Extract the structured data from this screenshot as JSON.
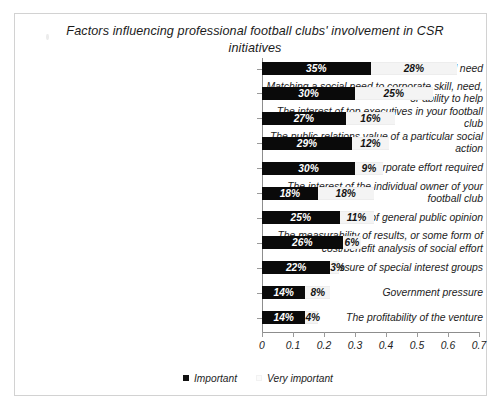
{
  "chart_data": {
    "type": "bar",
    "orientation": "horizontal",
    "stacked": true,
    "title": "Factors influencing professional football clubs' involvement in CSR initiatives",
    "xlabel": "",
    "ylabel": "",
    "xlim": [
      0,
      0.7
    ],
    "xticks": [
      "0",
      "0.1",
      "0.2",
      "0.3",
      "0.4",
      "0.5",
      "0.6",
      "0.7"
    ],
    "xtick_values": [
      0,
      0.1,
      0.2,
      0.3,
      0.4,
      0.5,
      0.6,
      0.7
    ],
    "grid": false,
    "legend_position": "bottom",
    "categories": [
      "The seriousness of a social need",
      "Matching a social need to corporate skill, need, or ability to help",
      "The interest of top executives in your football club",
      "The public relations value of a particular social action",
      "The amount of corporate effort required",
      "The interest of the individual owner of your football club",
      "The pressure of general public opinion",
      "The measurability of results, or some form of cost/benefit analysis of social effort",
      "Pressure of special interest groups",
      "Government pressure",
      "The profitability of the venture"
    ],
    "series": [
      {
        "name": "Important",
        "color": "#0a0a0a",
        "values": [
          0.35,
          0.3,
          0.27,
          0.29,
          0.3,
          0.18,
          0.25,
          0.26,
          0.22,
          0.14,
          0.14
        ],
        "labels": [
          "35%",
          "30%",
          "27%",
          "29%",
          "30%",
          "18%",
          "25%",
          "26%",
          "22%",
          "14%",
          "14%"
        ]
      },
      {
        "name": "Very important",
        "color": "#f4f4f4",
        "values": [
          0.28,
          0.25,
          0.16,
          0.12,
          0.09,
          0.18,
          0.11,
          0.06,
          0.03,
          0.08,
          0.04
        ],
        "labels": [
          "28%",
          "25%",
          "16%",
          "12%",
          "9%",
          "18%",
          "11%",
          "6%",
          "3%",
          "8%",
          "4%"
        ]
      }
    ]
  },
  "legend": {
    "items": [
      {
        "label": "Important",
        "swatch": "legend-swatch-important"
      },
      {
        "label": "Very important",
        "swatch": "legend-swatch-very-important"
      }
    ]
  }
}
